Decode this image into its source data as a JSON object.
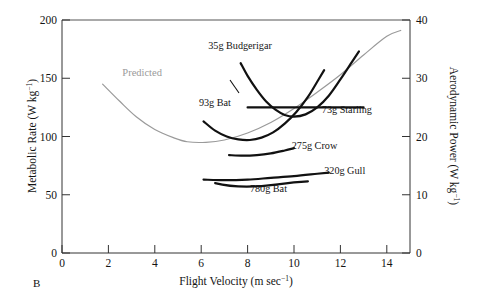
{
  "figure": {
    "panel_label": "B",
    "background": "#ffffff",
    "predicted_color": "#9a9a9a",
    "curve_color": "#111111",
    "axis_color": "#333333"
  },
  "chart_data": {
    "type": "line",
    "title": "",
    "subtitle": "",
    "xlabel": "Flight Velocity (m sec",
    "xlabel_sup": "−1",
    "xlabel_tail": ")",
    "ylabel": "Metabolic Rate (W kg",
    "ylabel_sup": "−1",
    "ylabel_tail": ")",
    "y2label": "Aerodynamic Power (W kg",
    "y2label_sup": "−1",
    "y2label_tail": ")",
    "xlim": [
      0,
      15
    ],
    "ylim": [
      0,
      200
    ],
    "y2lim": [
      0,
      40
    ],
    "grid": false,
    "legend": "inline-annotations",
    "xticks": [
      0,
      2,
      4,
      6,
      8,
      10,
      12,
      14
    ],
    "xtick_labels": [
      "0",
      "2",
      "4",
      "6",
      "8",
      "10",
      "12",
      "14"
    ],
    "yticks": [
      0,
      50,
      100,
      150,
      200
    ],
    "ytick_labels": [
      "0",
      "50",
      "100",
      "150",
      "200"
    ],
    "y2ticks": [
      0,
      10,
      20,
      30,
      40
    ],
    "y2tick_labels": [
      "0",
      "10",
      "20",
      "30",
      "40"
    ],
    "series": [
      {
        "name": "Predicted",
        "label": "Predicted",
        "color": "#9a9a9a",
        "style": "thin-gray",
        "label_xy": [
          2.6,
          152
        ],
        "points": [
          [
            1.75,
            145
          ],
          [
            2.5,
            130
          ],
          [
            3.2,
            117
          ],
          [
            4.0,
            106
          ],
          [
            4.8,
            99
          ],
          [
            5.4,
            95.5
          ],
          [
            6.2,
            95
          ],
          [
            7.0,
            97
          ],
          [
            8.0,
            103
          ],
          [
            9.0,
            112
          ],
          [
            10.0,
            124
          ],
          [
            11.0,
            138
          ],
          [
            12.0,
            153
          ],
          [
            13.0,
            170
          ],
          [
            14.0,
            186
          ],
          [
            14.6,
            191
          ]
        ]
      },
      {
        "name": "35g Budgerigar",
        "label": "35g Budgerigar",
        "color": "#111111",
        "style": "thick-black",
        "label_xy": [
          6.3,
          175
        ],
        "points": [
          [
            7.7,
            163
          ],
          [
            8.0,
            152
          ],
          [
            8.4,
            140
          ],
          [
            8.8,
            130
          ],
          [
            9.2,
            123
          ],
          [
            9.6,
            118.5
          ],
          [
            10.0,
            117
          ],
          [
            10.5,
            119
          ],
          [
            11.0,
            125
          ],
          [
            11.5,
            135
          ],
          [
            12.0,
            149
          ],
          [
            12.5,
            164
          ],
          [
            12.8,
            173
          ]
        ]
      },
      {
        "name": "93g Bat",
        "label": "93g Bat",
        "color": "#111111",
        "style": "thick-black",
        "label_xy": [
          5.9,
          126
        ],
        "points": [
          [
            6.1,
            113
          ],
          [
            6.6,
            105
          ],
          [
            7.1,
            100
          ],
          [
            7.6,
            97.5
          ],
          [
            8.1,
            97
          ],
          [
            8.6,
            99
          ],
          [
            9.1,
            103.5
          ],
          [
            9.6,
            111
          ],
          [
            10.1,
            121
          ],
          [
            10.6,
            134
          ],
          [
            11.0,
            147
          ],
          [
            11.3,
            157
          ]
        ]
      },
      {
        "name": "73g Starling",
        "label": "73g Starling",
        "color": "#111111",
        "style": "thick-black-horizontal",
        "label_xy": [
          11.2,
          120
        ],
        "points": [
          [
            8.0,
            125
          ],
          [
            9.0,
            125
          ],
          [
            10.0,
            125
          ],
          [
            11.0,
            125
          ],
          [
            12.0,
            125
          ],
          [
            13.0,
            125
          ]
        ]
      },
      {
        "name": "275g Crow",
        "label": "275g Crow",
        "color": "#111111",
        "style": "thick-black",
        "label_xy": [
          9.9,
          89
        ],
        "points": [
          [
            7.2,
            84
          ],
          [
            7.8,
            83.5
          ],
          [
            8.4,
            84
          ],
          [
            9.0,
            85.5
          ],
          [
            9.6,
            88
          ],
          [
            10.0,
            90
          ]
        ]
      },
      {
        "name": "320g Gull",
        "label": "320g Gull",
        "color": "#111111",
        "style": "thick-black",
        "label_xy": [
          11.3,
          68
        ],
        "points": [
          [
            6.1,
            63
          ],
          [
            7.0,
            62.5
          ],
          [
            8.0,
            63
          ],
          [
            9.0,
            64.5
          ],
          [
            10.0,
            66
          ],
          [
            11.0,
            68
          ],
          [
            11.5,
            69
          ]
        ]
      },
      {
        "name": "780g Bat",
        "label": "780g Bat",
        "color": "#111111",
        "style": "thick-black",
        "label_xy": [
          8.1,
          52
        ]
      }
    ]
  }
}
